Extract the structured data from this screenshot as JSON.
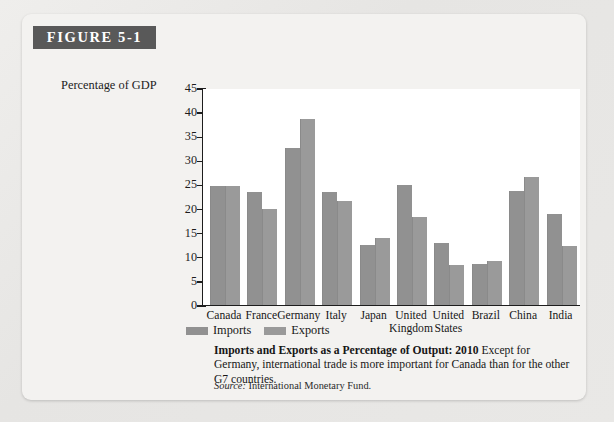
{
  "figure": {
    "banner_label": "FIGURE 5-1"
  },
  "axis": {
    "y_title": "Percentage of GDP",
    "y_ticks": [
      "45",
      "40",
      "35",
      "30",
      "25",
      "20",
      "15",
      "10",
      "5",
      "0"
    ]
  },
  "legend": {
    "items": [
      {
        "label": "Imports",
        "color": "#919191"
      },
      {
        "label": "Exports",
        "color": "#9a9a9a"
      }
    ]
  },
  "caption": {
    "bold": "Imports and Exports as a Percentage of Output: 2010",
    "text": "Except for Germany, international trade is more important for Canada than for the other G7 countries."
  },
  "source": {
    "label": "Source:",
    "value": "International Monetary Fund."
  },
  "chart_data": {
    "type": "bar",
    "title": "Imports and Exports as a Percentage of Output: 2010",
    "xlabel": "",
    "ylabel": "Percentage of GDP",
    "ylim": [
      0,
      45
    ],
    "ytick_step": 5,
    "grid": false,
    "legend_position": "below-axis-left",
    "categories": [
      "Canada",
      "France",
      "Germany",
      "Italy",
      "Japan",
      "United Kingdom",
      "United States",
      "Brazil",
      "China",
      "India"
    ],
    "series": [
      {
        "name": "Imports",
        "color": "#919191",
        "values": [
          24.7,
          23.5,
          32.5,
          23.5,
          12.5,
          24.8,
          12.8,
          8.6,
          23.6,
          18.8
        ]
      },
      {
        "name": "Exports",
        "color": "#9a9a9a",
        "values": [
          24.6,
          20.0,
          38.6,
          21.5,
          13.8,
          18.2,
          8.3,
          9.2,
          26.5,
          12.2
        ]
      }
    ]
  }
}
